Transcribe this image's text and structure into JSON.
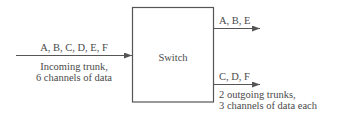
{
  "diagram": {
    "switch": {
      "label": "Switch"
    },
    "incoming": {
      "channels": "A, B, C, D, E, F",
      "caption_line1": "Incoming trunk,",
      "caption_line2": "6 channels of data"
    },
    "outgoing": [
      {
        "channels": "A, B, E"
      },
      {
        "channels": "C, D, F"
      }
    ],
    "outgoing_caption_line1": "2 outgoing trunks,",
    "outgoing_caption_line2": "3 channels of data each",
    "colors": {
      "line": "#555555",
      "text": "#4a4a4a",
      "background": "#ffffff"
    }
  }
}
